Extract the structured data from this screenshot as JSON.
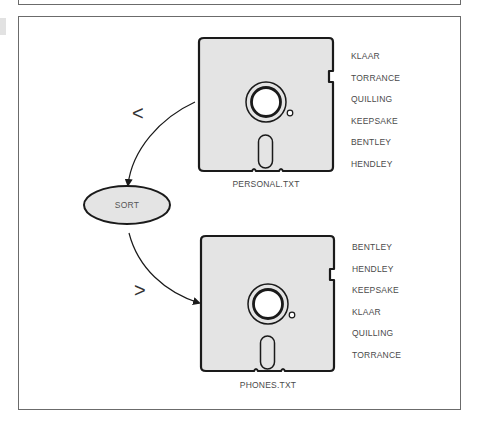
{
  "diagram": {
    "title": "",
    "source_disk": {
      "filename": "PERSONAL.TXT",
      "records": [
        "KLAAR",
        "TORRANCE",
        "QUILLING",
        "KEEPSAKE",
        "BENTLEY",
        "HENDLEY"
      ]
    },
    "process": {
      "label": "SORT",
      "input_symbol": "<",
      "output_symbol": ">"
    },
    "output_disk": {
      "filename": "PHONES.TXT",
      "records": [
        "BENTLEY",
        "HENDLEY",
        "KEEPSAKE",
        "KLAAR",
        "QUILLING",
        "TORRANCE"
      ]
    },
    "colors": {
      "disk_fill": "#e4e4e4",
      "outline": "#1a1a1a",
      "frame": "#6b6b6b",
      "text": "#4a4a4a"
    }
  }
}
